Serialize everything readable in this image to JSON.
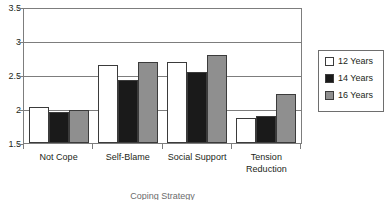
{
  "chart_data": {
    "type": "bar",
    "title": "",
    "xlabel": "Coping Strategy",
    "ylabel": "",
    "categories": [
      "Not Cope",
      "Self-Blame",
      "Social Support",
      "Tension Reduction"
    ],
    "series": [
      {
        "name": "12 Years",
        "color": "#ffffff",
        "values": [
          2.04,
          2.67,
          2.71,
          1.88
        ]
      },
      {
        "name": "14 Years",
        "color": "#1a1a1a",
        "values": [
          1.97,
          2.44,
          2.56,
          1.9
        ]
      },
      {
        "name": "16 Years",
        "color": "#8f8f8f",
        "values": [
          1.99,
          2.71,
          2.81,
          2.23
        ]
      }
    ],
    "ylim": [
      1.5,
      3.5
    ],
    "yticks": [
      "1.5",
      "2",
      "2.5",
      "3",
      "3.5"
    ],
    "ytick_values": [
      1.5,
      2,
      2.5,
      3,
      3.5
    ],
    "grid": true,
    "legend_position": "right"
  },
  "legend": {
    "items": [
      {
        "label": "12 Years",
        "swatch": "legend-swatch-12-years"
      },
      {
        "label": "14 Years",
        "swatch": "legend-swatch-14-years"
      },
      {
        "label": "16 Years",
        "swatch": "legend-swatch-16-years"
      }
    ]
  }
}
